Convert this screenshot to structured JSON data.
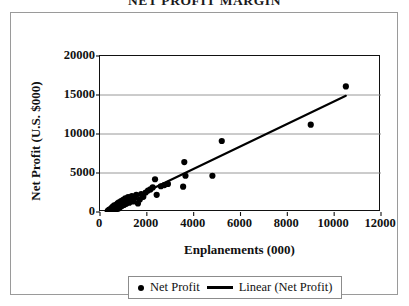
{
  "chart_data": {
    "type": "scatter",
    "title": "NET PROFIT MARGIN",
    "xlabel": "Enplanements (000)",
    "ylabel": "Net Profit (U.S. $000)",
    "xlim": [
      0,
      12000
    ],
    "ylim": [
      0,
      20000
    ],
    "xticks": [
      "0",
      "2000",
      "4000",
      "6000",
      "8000",
      "10000",
      "12000"
    ],
    "xtick_values": [
      0,
      2000,
      4000,
      6000,
      8000,
      10000,
      12000
    ],
    "yticks": [
      "0",
      "5000",
      "10000",
      "15000",
      "20000"
    ],
    "ytick_values": [
      0,
      5000,
      10000,
      15000,
      20000
    ],
    "grid": "horizontal",
    "legend_position": "bottom",
    "marker_color": "#000000",
    "line_color": "#000000",
    "plot_border_color": "#111111",
    "gridline_color": "#8d8d8d",
    "series": [
      {
        "name": "Net Profit",
        "type": "scatter",
        "marker": "circle",
        "points": [
          [
            330,
            120
          ],
          [
            360,
            200
          ],
          [
            390,
            150
          ],
          [
            400,
            320
          ],
          [
            420,
            260
          ],
          [
            450,
            180
          ],
          [
            470,
            420
          ],
          [
            490,
            300
          ],
          [
            510,
            560
          ],
          [
            530,
            230
          ],
          [
            550,
            700
          ],
          [
            570,
            400
          ],
          [
            590,
            330
          ],
          [
            610,
            850
          ],
          [
            630,
            480
          ],
          [
            650,
            280
          ],
          [
            670,
            640
          ],
          [
            690,
            930
          ],
          [
            710,
            520
          ],
          [
            730,
            380
          ],
          [
            750,
            1100
          ],
          [
            770,
            700
          ],
          [
            790,
            450
          ],
          [
            810,
            1250
          ],
          [
            830,
            860
          ],
          [
            850,
            600
          ],
          [
            880,
            1000
          ],
          [
            900,
            1400
          ],
          [
            930,
            760
          ],
          [
            960,
            1150
          ],
          [
            990,
            1550
          ],
          [
            1020,
            900
          ],
          [
            1050,
            1300
          ],
          [
            1080,
            1750
          ],
          [
            1120,
            1050
          ],
          [
            1160,
            1450
          ],
          [
            1200,
            1900
          ],
          [
            1250,
            1200
          ],
          [
            1300,
            1600
          ],
          [
            1360,
            2050
          ],
          [
            1420,
            1350
          ],
          [
            1480,
            1800
          ],
          [
            1550,
            2200
          ],
          [
            1620,
            1100
          ],
          [
            1700,
            1600
          ],
          [
            1760,
            2300
          ],
          [
            1850,
            1950
          ],
          [
            1950,
            2500
          ],
          [
            2050,
            2750
          ],
          [
            2150,
            2900
          ],
          [
            2250,
            3150
          ],
          [
            2350,
            4200
          ],
          [
            2420,
            2200
          ],
          [
            2600,
            3300
          ],
          [
            2750,
            3450
          ],
          [
            2900,
            3600
          ],
          [
            3550,
            3250
          ],
          [
            3600,
            6400
          ],
          [
            3650,
            4650
          ],
          [
            4800,
            4650
          ],
          [
            5200,
            9100
          ],
          [
            9000,
            11200
          ],
          [
            10500,
            16100
          ]
        ]
      },
      {
        "name": "Linear (Net Profit)",
        "type": "trendline",
        "x0": 300,
        "y0": 200,
        "x1": 10500,
        "y1": 14900
      }
    ]
  },
  "legend": {
    "entries": [
      {
        "label": "Net Profit",
        "marker": "dot"
      },
      {
        "label": "Linear (Net Profit)",
        "marker": "line"
      }
    ]
  }
}
